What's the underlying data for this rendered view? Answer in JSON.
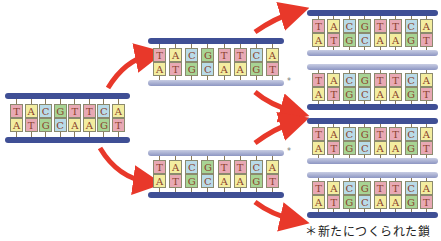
{
  "colors": {
    "T": "#e8a9b4",
    "A": "#f3eda0",
    "C": "#b9dbe8",
    "G": "#a8d494",
    "old_strand": "#3f4f95",
    "new_strand": "#aab1d3",
    "arrow": "#e8382a"
  },
  "sequence": {
    "top": [
      "T",
      "A",
      "C",
      "G",
      "T",
      "T",
      "C",
      "A"
    ],
    "bottom": [
      "A",
      "T",
      "G",
      "C",
      "A",
      "A",
      "G",
      "T"
    ]
  },
  "new_strand_mark": "*",
  "caption": "＊新たにつくられた鎖",
  "generations": [
    {
      "label": "parent",
      "duplexes": 1
    },
    {
      "label": "generation-1",
      "duplexes": 2
    },
    {
      "label": "generation-2",
      "duplexes": 4
    }
  ]
}
